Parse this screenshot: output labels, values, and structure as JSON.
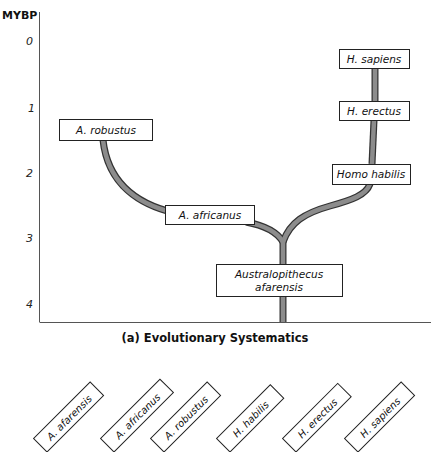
{
  "figure": {
    "y_axis": {
      "label": "MYBP",
      "ticks": [
        "0",
        "1",
        "2",
        "3",
        "4"
      ]
    },
    "boxes": {
      "a_robustus": "A. robustus",
      "a_africanus": "A. africanus",
      "afarensis_line1": "Australopithecus",
      "afarensis_line2": "afarensis",
      "h_sapiens": "H. sapiens",
      "h_erectus": "H. erectus",
      "homo_habilis": "Homo habilis"
    },
    "caption": "(a) Evolutionary Systematics",
    "cladogram_labels": [
      "A. afarensis",
      "A. africanus",
      "A. robustus",
      "H. habilis",
      "H. erectus",
      "H. sapiens"
    ]
  },
  "colors": {
    "branch_fill": "#8c8c8c",
    "branch_outline": "#333333",
    "box_border": "#222222",
    "background": "#ffffff"
  }
}
